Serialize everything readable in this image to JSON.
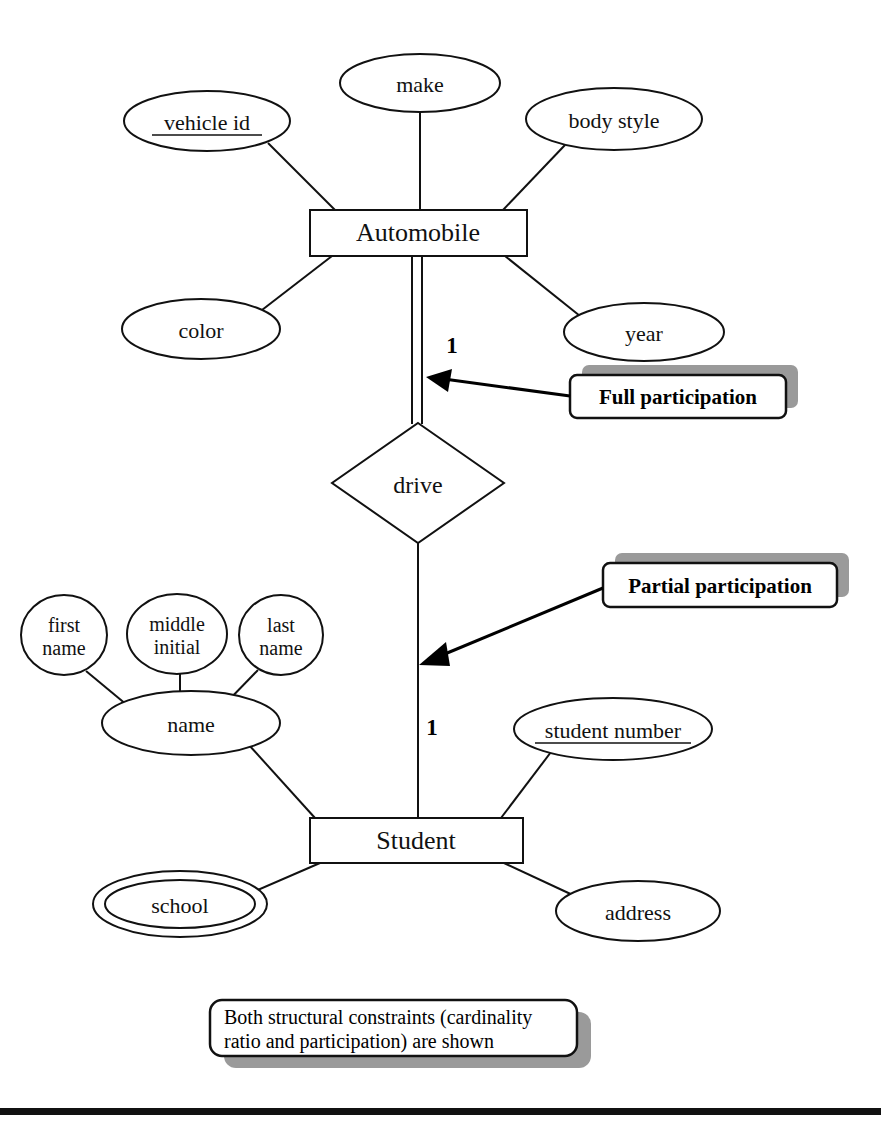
{
  "diagram": {
    "type": "entity-relationship-diagram",
    "background_color": "#ffffff",
    "line_color": "#111111",
    "shadow_color": "#9a9a9a"
  },
  "entities": [
    {
      "id": "automobile",
      "label": "Automobile",
      "shape": "rectangle",
      "x": 310,
      "y": 210,
      "width": 217,
      "height": 46
    },
    {
      "id": "student",
      "label": "Student",
      "shape": "rectangle",
      "x": 310,
      "y": 818,
      "width": 213,
      "height": 45
    }
  ],
  "relationships": [
    {
      "id": "drive",
      "label": "drive",
      "shape": "diamond",
      "cx": 418,
      "cy": 483,
      "rx": 86,
      "ry": 60,
      "participation_automobile": "total",
      "participation_student": "partial",
      "cardinality_automobile": "1",
      "cardinality_student": "1"
    }
  ],
  "attributes": [
    {
      "id": "vehicle-id",
      "label": "vehicle id",
      "owner": "automobile",
      "kind": "key",
      "underlined": true,
      "shape": "ellipse",
      "cx": 207,
      "cy": 121,
      "rx": 83,
      "ry": 30
    },
    {
      "id": "make",
      "label": "make",
      "owner": "automobile",
      "kind": "simple",
      "underlined": false,
      "shape": "ellipse",
      "cx": 420,
      "cy": 83,
      "rx": 80,
      "ry": 29
    },
    {
      "id": "body-style",
      "label": "body style",
      "owner": "automobile",
      "kind": "simple",
      "underlined": false,
      "shape": "ellipse",
      "cx": 614,
      "cy": 119,
      "rx": 88,
      "ry": 31
    },
    {
      "id": "color",
      "label": "color",
      "owner": "automobile",
      "kind": "simple",
      "underlined": false,
      "shape": "ellipse",
      "cx": 201,
      "cy": 329,
      "rx": 79,
      "ry": 30
    },
    {
      "id": "year",
      "label": "year",
      "owner": "automobile",
      "kind": "simple",
      "underlined": false,
      "shape": "ellipse",
      "cx": 644,
      "cy": 332,
      "rx": 80,
      "ry": 29
    },
    {
      "id": "first-name",
      "label": "first name",
      "label_line1": "first",
      "label_line2": "name",
      "owner": "name",
      "kind": "component",
      "underlined": false,
      "shape": "circle",
      "cx": 64,
      "cy": 635,
      "rx": 43,
      "ry": 40
    },
    {
      "id": "middle-initial",
      "label": "middle initial",
      "label_line1": "middle",
      "label_line2": "initial",
      "owner": "name",
      "kind": "component",
      "underlined": false,
      "shape": "circle",
      "cx": 177,
      "cy": 634,
      "rx": 50,
      "ry": 40
    },
    {
      "id": "last-name",
      "label": "last name",
      "label_line1": "last",
      "label_line2": "name",
      "owner": "name",
      "kind": "component",
      "underlined": false,
      "shape": "circle",
      "cx": 281,
      "cy": 635,
      "rx": 42,
      "ry": 40
    },
    {
      "id": "name",
      "label": "name",
      "owner": "student",
      "kind": "composite",
      "underlined": false,
      "shape": "ellipse",
      "cx": 191,
      "cy": 723,
      "rx": 89,
      "ry": 32
    },
    {
      "id": "student-number",
      "label": "student number",
      "owner": "student",
      "kind": "key",
      "underlined": true,
      "shape": "ellipse",
      "cx": 613,
      "cy": 729,
      "rx": 99,
      "ry": 31
    },
    {
      "id": "school",
      "label": "school",
      "owner": "student",
      "kind": "multivalued",
      "underlined": false,
      "shape": "double-ellipse",
      "cx": 180,
      "cy": 904,
      "rx": 87,
      "ry": 33
    },
    {
      "id": "address",
      "label": "address",
      "owner": "student",
      "kind": "simple",
      "underlined": false,
      "shape": "ellipse",
      "cx": 638,
      "cy": 911,
      "rx": 82,
      "ry": 30
    }
  ],
  "cardinality_labels": [
    {
      "id": "card-top",
      "text": "1",
      "x": 452,
      "y": 353
    },
    {
      "id": "card-bottom",
      "text": "1",
      "x": 432,
      "y": 735
    }
  ],
  "callouts": [
    {
      "id": "full-participation",
      "text": "Full participation",
      "box": {
        "x": 570,
        "y": 375,
        "width": 216,
        "height": 43
      },
      "shadow_offset": {
        "dx": 12,
        "dy": -10
      },
      "arrow": {
        "x1": 570,
        "y1": 396,
        "x2": 430,
        "y2": 377
      }
    },
    {
      "id": "partial-participation",
      "text": "Partial participation",
      "box": {
        "x": 603,
        "y": 563,
        "width": 234,
        "height": 44
      },
      "shadow_offset": {
        "dx": 12,
        "dy": -10
      },
      "arrow": {
        "x1": 603,
        "y1": 588,
        "x2": 418,
        "y2": 667
      }
    }
  ],
  "note": {
    "id": "structural-constraints-note",
    "line1": "Both structural constraints (cardinality",
    "line2": "ratio and participation) are shown",
    "box": {
      "x": 210,
      "y": 1000,
      "width": 367,
      "height": 56
    },
    "shadow_offset": {
      "dx": 14,
      "dy": 12
    }
  },
  "footer_rule": {
    "x": 0,
    "y": 1108,
    "width": 881,
    "height": 7
  }
}
